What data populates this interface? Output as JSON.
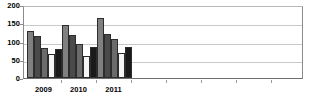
{
  "chart_data": {
    "type": "bar",
    "title": "",
    "subtitle": "",
    "xlabel": "",
    "ylabel": "",
    "categories": [
      "2009",
      "2010",
      "2011"
    ],
    "ylim": [
      0,
      200
    ],
    "y_ticks": [
      0,
      50,
      100,
      150,
      200
    ],
    "y_tick_labels": [
      "0",
      "50",
      "100",
      "150",
      "200"
    ],
    "grid": true,
    "legend": false,
    "legend_position": "none",
    "series": [
      {
        "name": "series-1",
        "color": "#808080",
        "values": [
          128,
          145,
          165
        ]
      },
      {
        "name": "series-2",
        "color": "#4a4a4a",
        "values": [
          115,
          118,
          120
        ]
      },
      {
        "name": "series-3",
        "color": "#6b6b6b",
        "values": [
          82,
          93,
          107
        ]
      },
      {
        "name": "series-4",
        "color": "#f5f5f5",
        "values": [
          65,
          60,
          68
        ]
      },
      {
        "name": "series-5",
        "color": "#1a1a1a",
        "values": [
          79,
          84,
          86
        ]
      }
    ]
  }
}
